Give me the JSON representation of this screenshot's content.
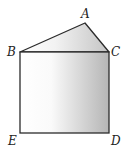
{
  "diagram": {
    "type": "geometry-figure",
    "points": {
      "A": {
        "label": "A",
        "x": 85,
        "y": 23
      },
      "B": {
        "label": "B",
        "x": 20,
        "y": 52
      },
      "C": {
        "label": "C",
        "x": 109,
        "y": 52
      },
      "D": {
        "label": "D",
        "x": 109,
        "y": 133
      },
      "E": {
        "label": "E",
        "x": 20,
        "y": 133
      }
    },
    "segments": [
      "AB",
      "AC",
      "BC",
      "CD",
      "DE",
      "EB"
    ],
    "colors": {
      "stroke": "#2b2b2b",
      "fill_light": "#ffffff",
      "fill_dark": "#b8b8b8"
    }
  }
}
